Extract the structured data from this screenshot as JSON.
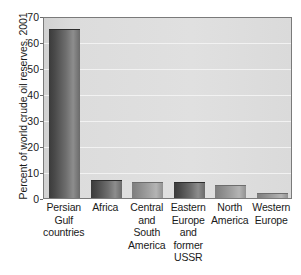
{
  "chart_data": {
    "type": "bar",
    "title": "",
    "xlabel": "",
    "ylabel": "Percent of world crude oil reserves, 2001",
    "ylim": [
      0,
      70
    ],
    "yticks": [
      0,
      10,
      20,
      30,
      40,
      50,
      60,
      70
    ],
    "ytick_labels": [
      "0",
      "10",
      "20",
      "30",
      "40",
      "50",
      "60",
      "70"
    ],
    "grid": true,
    "legend": "none",
    "categories": [
      "Persian Gulf countries",
      "Africa",
      "Central and South America",
      "Eastern Europe and former USSR",
      "North America",
      "Western Europe"
    ],
    "category_lines": [
      [
        "Persian",
        "Gulf",
        "countries"
      ],
      [
        "Africa"
      ],
      [
        "Central",
        "and",
        "South",
        "America"
      ],
      [
        "Eastern",
        "Europe",
        "and",
        "former",
        "USSR"
      ],
      [
        "North",
        "America"
      ],
      [
        "Western",
        "Europe"
      ]
    ],
    "values": [
      65,
      7,
      6,
      6,
      5,
      2
    ],
    "colors": {
      "bar_dark": "#4a4a4a",
      "bar_light": "#8f8f8f",
      "plot_background": "#dcdcdc",
      "gridline": "#f2f2f2",
      "frame": "#7a7a7a",
      "text": "#1a1a1a",
      "page_background": "#ffffff"
    }
  }
}
